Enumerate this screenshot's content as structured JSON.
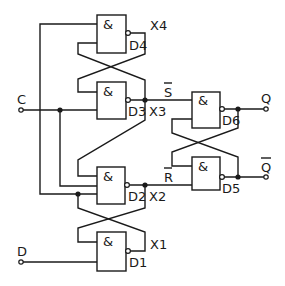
{
  "diagram": {
    "title": "",
    "inputs": [
      {
        "id": "C",
        "label": "C"
      },
      {
        "id": "D",
        "label": "D"
      }
    ],
    "outputs": [
      {
        "id": "Q",
        "label": "Q"
      },
      {
        "id": "Qbar",
        "label": "Q̅",
        "overline": true
      }
    ],
    "gates": [
      {
        "id": "D4",
        "symbol": "&",
        "label": "D4",
        "type": "NAND"
      },
      {
        "id": "D3",
        "symbol": "&",
        "label": "D3",
        "type": "NAND"
      },
      {
        "id": "D6",
        "symbol": "&",
        "label": "D6",
        "type": "NAND"
      },
      {
        "id": "D5",
        "symbol": "&",
        "label": "D5",
        "type": "NAND"
      },
      {
        "id": "D2",
        "symbol": "&",
        "label": "D2",
        "type": "NAND"
      },
      {
        "id": "D1",
        "symbol": "&",
        "label": "D1",
        "type": "NAND"
      }
    ],
    "nodes": [
      {
        "id": "X4",
        "label": "X4"
      },
      {
        "id": "X3",
        "label": "X3"
      },
      {
        "id": "X2",
        "label": "X2"
      },
      {
        "id": "X1",
        "label": "X1"
      }
    ],
    "signals": {
      "s_bar": "S",
      "r_bar": "R"
    },
    "colors": {
      "line": "#1a1a1a",
      "background": "#ffffff"
    }
  }
}
